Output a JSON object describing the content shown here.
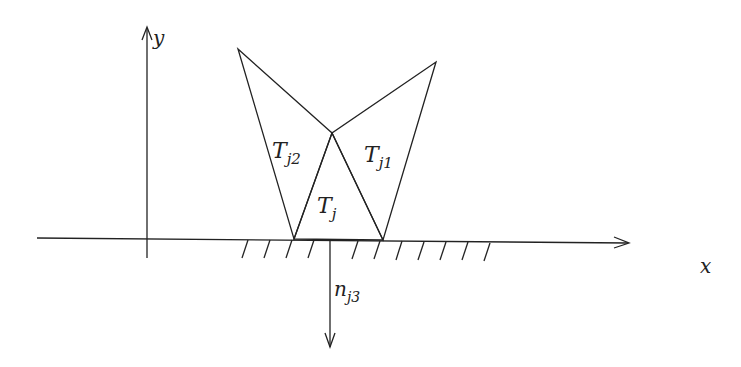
{
  "labels": {
    "y_axis": "y",
    "x_axis": "x",
    "t_j": "T",
    "t_j_sub": "j",
    "t_j1": "T",
    "t_j1_sub": "j1",
    "t_j2": "T",
    "t_j2_sub": "j2",
    "n_j3": "n",
    "n_j3_sub": "j3"
  },
  "colors": {
    "stroke": "#222222",
    "background": "#ffffff"
  }
}
